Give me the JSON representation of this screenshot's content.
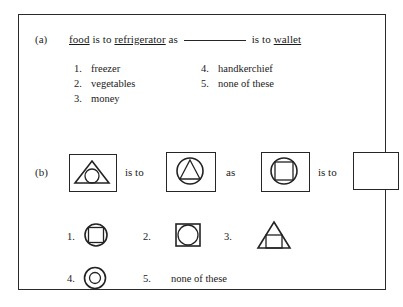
{
  "document": {
    "type": "analogy-test-question",
    "frame_color": "#2b2b2b"
  },
  "part_a": {
    "label": "(a)",
    "stem": {
      "term1": "food",
      "connector1": "is to",
      "term2": "refrigerator",
      "connector2": "as",
      "blank": "__________",
      "connector3": "is to",
      "term3": "wallet"
    },
    "options": [
      {
        "number": "1.",
        "label": "freezer"
      },
      {
        "number": "2.",
        "label": "vegetables"
      },
      {
        "number": "3.",
        "label": "money"
      },
      {
        "number": "4.",
        "label": "handkerchief"
      },
      {
        "number": "5.",
        "label": "none of these"
      }
    ]
  },
  "part_b": {
    "label": "(b)",
    "connector_is_to_1": "is to",
    "connector_as": "as",
    "connector_is_to_2": "is to",
    "figures": [
      {
        "name": "circle-in-triangle-figure",
        "description": "triangle containing circle"
      },
      {
        "name": "triangle-in-circle-figure",
        "description": "circle containing triangle"
      },
      {
        "name": "square-in-circle-figure",
        "description": "circle containing square"
      },
      {
        "name": "empty-answer-figure",
        "description": "blank box"
      }
    ],
    "options": [
      {
        "number": "1.",
        "figure": "square-in-circle-option",
        "label": ""
      },
      {
        "number": "2.",
        "figure": "circle-in-square-option",
        "label": ""
      },
      {
        "number": "3.",
        "figure": "square-in-triangle-option",
        "label": ""
      },
      {
        "number": "4.",
        "figure": "circle-in-circle-option",
        "label": ""
      },
      {
        "number": "5.",
        "figure": "",
        "label": "none of these"
      }
    ]
  }
}
